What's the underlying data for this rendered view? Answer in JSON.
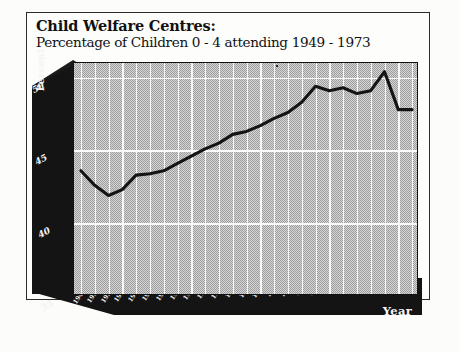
{
  "document": {
    "title_main": "Child Welfare Centres:",
    "title_sub": "Percentage of Children 0 - 4 attending 1949 - 1973"
  },
  "axes": {
    "y_title": "Percent",
    "x_title": "Year",
    "y_ticks": [
      "50",
      "45",
      "40",
      "35"
    ],
    "y_tick_values": [
      50,
      45,
      40,
      35
    ]
  },
  "chart_data": {
    "type": "line",
    "title": "Child Welfare Centres: Percentage of Children 0 - 4 attending 1949 - 1973",
    "xlabel": "Year",
    "ylabel": "Percent",
    "ylim": [
      35,
      51
    ],
    "yticks": [
      35,
      40,
      45,
      50
    ],
    "grid": true,
    "legend": "none",
    "line_color": "#141414",
    "plot_background": "#b9b9b9",
    "categories": [
      "1949",
      "1950",
      "1951",
      "1952",
      "1953",
      "1954",
      "1955",
      "1956",
      "1957",
      "1958",
      "1959",
      "1960",
      "1961",
      "1962",
      "1963",
      "1964",
      "1965",
      "1966",
      "1967",
      "1968",
      "1969",
      "1970",
      "1971",
      "1972",
      "1973"
    ],
    "series": [
      {
        "name": "Percentage of children 0 - 4 attending",
        "values": [
          43.6,
          42.6,
          41.9,
          42.3,
          43.3,
          43.4,
          43.6,
          44.1,
          44.6,
          45.1,
          45.5,
          46.1,
          46.3,
          46.7,
          47.2,
          47.6,
          48.3,
          49.4,
          49.1,
          49.3,
          48.9,
          49.1,
          50.4,
          47.8,
          47.8
        ]
      }
    ]
  }
}
